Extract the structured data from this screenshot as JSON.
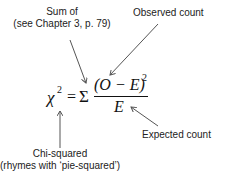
{
  "diagram": {
    "formula": {
      "chi": "χ",
      "exp2": "2",
      "equals": "=",
      "sigma": "Σ",
      "numerator": "(O − E)",
      "num_exp": "2",
      "denominator": "E"
    },
    "annotations": {
      "sum_of_line1": "Sum of",
      "sum_of_line2": "(see Chapter 3, p. 79)",
      "observed": "Observed count",
      "expected": "Expected count",
      "chi_line1": "Chi-squared",
      "chi_line2": "(rhymes with ‘pie-squared’)"
    }
  }
}
